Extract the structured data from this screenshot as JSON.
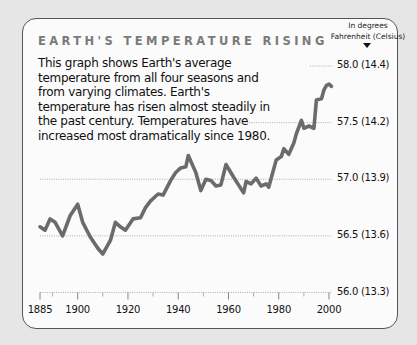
{
  "title": "EARTH'S TEMPERATURE RISING",
  "description": "This graph shows Earth's average temperature from all four seasons and from varying climates. Earth's temperature has risen almost steadily in the past century. Temperatures have increased most dramatically since 1980.",
  "units": {
    "line1": "In degrees",
    "line2": "Fahrenheit (Celsius)"
  },
  "y_ticks": [
    {
      "value": 58.0,
      "label": "58.0 (14.4)",
      "grid_from_x": 310
    },
    {
      "value": 57.5,
      "label": "57.5 (14.2)",
      "grid_from_x": 240
    },
    {
      "value": 57.0,
      "label": "57.0 (13.9)",
      "grid_from_x": 40
    },
    {
      "value": 56.5,
      "label": "56.5 (13.6)",
      "grid_from_x": 40
    },
    {
      "value": 56.0,
      "label": "56.0 (13.3)",
      "grid_from_x": 40
    }
  ],
  "x_ticks": [
    {
      "year": 1885,
      "label": "1885"
    },
    {
      "year": 1900,
      "label": "1900"
    },
    {
      "year": 1920,
      "label": "1920"
    },
    {
      "year": 1940,
      "label": "1940"
    },
    {
      "year": 1960,
      "label": "1960"
    },
    {
      "year": 1980,
      "label": "1980"
    },
    {
      "year": 2000,
      "label": "2000"
    }
  ],
  "x_minor_ticks": [
    1890,
    1910,
    1930,
    1950,
    1970,
    1990
  ],
  "colors": {
    "line": "#6b6b6b",
    "grid": "#9a9a9a",
    "title": "#7a7a7a",
    "card": "#fbfbfb",
    "background": "#e6e6e6"
  },
  "chart_data": {
    "type": "line",
    "title": "EARTH'S TEMPERATURE RISING",
    "xlabel": "",
    "ylabel": "In degrees Fahrenheit (Celsius)",
    "xlim": [
      1885,
      2001
    ],
    "ylim": [
      56.0,
      58.0
    ],
    "grid": true,
    "legend": null,
    "y_tick_labels": [
      "56.0 (13.3)",
      "56.5 (13.6)",
      "57.0 (13.9)",
      "57.5 (14.2)",
      "58.0 (14.4)"
    ],
    "x_tick_labels": [
      "1885",
      "1900",
      "1920",
      "1940",
      "1960",
      "1980",
      "2000"
    ],
    "series": [
      {
        "name": "Average temperature (°F)",
        "x": [
          1885,
          1887,
          1889,
          1891,
          1894,
          1897,
          1900,
          1902,
          1905,
          1908,
          1910,
          1913,
          1915,
          1917,
          1919,
          1922,
          1925,
          1927,
          1929,
          1932,
          1934,
          1937,
          1939,
          1941,
          1943,
          1944,
          1947,
          1949,
          1951,
          1953,
          1955,
          1957,
          1959,
          1962,
          1964,
          1966,
          1967,
          1969,
          1971,
          1973,
          1975,
          1976,
          1979,
          1981,
          1982,
          1984,
          1986,
          1987,
          1989,
          1990,
          1992,
          1994,
          1995,
          1997,
          1998,
          1999,
          2000,
          2001
        ],
        "values": [
          56.58,
          56.55,
          56.65,
          56.62,
          56.5,
          56.68,
          56.78,
          56.62,
          56.49,
          56.39,
          56.34,
          56.46,
          56.62,
          56.58,
          56.55,
          56.65,
          56.66,
          56.75,
          56.81,
          56.87,
          56.86,
          56.99,
          57.06,
          57.1,
          57.11,
          57.21,
          57.06,
          56.9,
          57.0,
          56.99,
          56.94,
          56.95,
          57.13,
          57.02,
          56.95,
          56.88,
          56.98,
          56.96,
          57.01,
          56.94,
          56.96,
          56.93,
          57.17,
          57.2,
          57.27,
          57.22,
          57.32,
          57.4,
          57.52,
          57.45,
          57.47,
          57.45,
          57.7,
          57.71,
          57.79,
          57.83,
          57.84,
          57.82
        ]
      }
    ]
  }
}
